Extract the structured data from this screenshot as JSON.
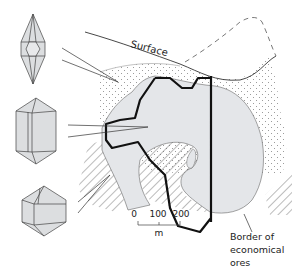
{
  "diagram": {
    "labels": {
      "surface": "Surface",
      "border_line1": "Border of",
      "border_line2": "economical",
      "border_line3": "ores"
    },
    "scale_bar": {
      "tick0": "0",
      "tick1": "100",
      "tick2": "200",
      "unit": "m"
    },
    "crystals": [
      {
        "name": "elongated-bipyramidal-crystal",
        "position": "top"
      },
      {
        "name": "prismatic-crystal",
        "position": "middle"
      },
      {
        "name": "short-bipyramidal-crystal",
        "position": "bottom"
      }
    ],
    "colors": {
      "ore_body_fill": "#e4e6e9",
      "crystal_fill": "#dcdee0",
      "line": "#222222",
      "border_line": "#111111",
      "dots": "#888888",
      "hatch": "#555555"
    }
  }
}
